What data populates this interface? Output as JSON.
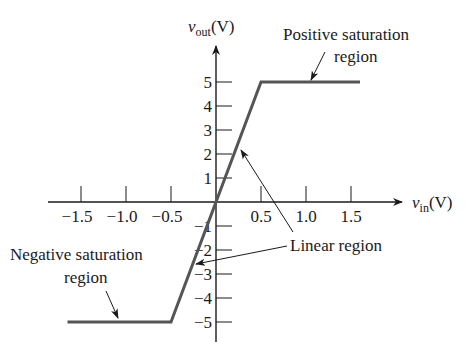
{
  "chart_data": {
    "type": "line",
    "title": "",
    "xlabel": "v_in(V)",
    "ylabel": "v_out(V)",
    "xlabel_parts": {
      "var": "v",
      "sub": "in",
      "unit": "(V)"
    },
    "ylabel_parts": {
      "var": "v",
      "sub": "out",
      "unit": "(V)"
    },
    "x_ticks": [
      "−1.5",
      "−1.0",
      "−0.5",
      "0.5",
      "1.0",
      "1.5"
    ],
    "x_tick_values": [
      -1.5,
      -1.0,
      -0.5,
      0.5,
      1.0,
      1.5
    ],
    "y_ticks": [
      "5",
      "4",
      "3",
      "2",
      "1",
      "−1",
      "−2",
      "−3",
      "−4",
      "−5"
    ],
    "y_tick_values": [
      5,
      4,
      3,
      2,
      1,
      -1,
      -2,
      -3,
      -4,
      -5
    ],
    "xlim": [
      -1.8,
      2.1
    ],
    "ylim": [
      -5.8,
      6.6
    ],
    "grid": false,
    "series": [
      {
        "name": "transfer characteristic",
        "x": [
          -1.65,
          -0.5,
          0.5,
          1.6
        ],
        "y": [
          -5,
          -5,
          5,
          5
        ],
        "color": "#555555"
      }
    ],
    "annotations": [
      {
        "text_lines": [
          "Positive saturation",
          "region"
        ],
        "points_to": [
          1.0,
          5
        ]
      },
      {
        "text_lines": [
          "Negative saturation",
          "region"
        ],
        "points_to": [
          -1.05,
          -5
        ]
      },
      {
        "text_lines": [
          "Linear region"
        ],
        "points_to": [
          [
            0.25,
            2.5
          ],
          [
            -0.25,
            -2.5
          ]
        ]
      }
    ]
  },
  "labels": {
    "pos_sat_1": "Positive saturation",
    "pos_sat_2": "region",
    "neg_sat_1": "Negative saturation",
    "neg_sat_2": "region",
    "linear": "Linear region",
    "xvar": "v",
    "xsub": "in",
    "xunit": "(V)",
    "yvar": "v",
    "ysub": "out",
    "yunit": "(V)"
  },
  "colors": {
    "axis": "#1a1a1a",
    "curve": "#555555",
    "text": "#1a1a1a"
  }
}
